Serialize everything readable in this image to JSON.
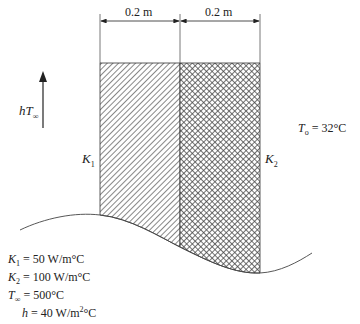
{
  "dimensions": [
    {
      "label": "0.2 m"
    },
    {
      "label": "0.2 m"
    }
  ],
  "flux_arrow": {
    "label_main": "hT",
    "label_sub": "∞"
  },
  "layers": [
    {
      "label_main": "K",
      "label_sub": "1",
      "pattern": "diagonal-hatch"
    },
    {
      "label_main": "K",
      "label_sub": "2",
      "pattern": "cross-hatch"
    }
  ],
  "ambient": {
    "label_main": "T",
    "label_sub": "o",
    "value": " = 32°C"
  },
  "properties": [
    {
      "sym": "K",
      "sub": "1",
      "sup": "",
      "text": " = 50 W/m°C"
    },
    {
      "sym": "K",
      "sub": "2",
      "sup": "",
      "text": " = 100 W/m°C"
    },
    {
      "sym": "T",
      "sub": "∞",
      "sup": "",
      "text": " = 500°C"
    },
    {
      "sym": "h",
      "sub": "",
      "text_before_sup": " = 40 W/m",
      "sup": "2",
      "text": "°C"
    }
  ],
  "colors": {
    "line": "#333333",
    "hatch": "#444444",
    "background": "#ffffff"
  }
}
